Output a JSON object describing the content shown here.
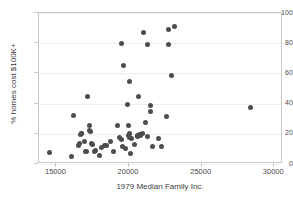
{
  "chart_data": {
    "type": "scatter",
    "title": "",
    "xlabel": "1979 Median Family Inc.",
    "ylabel": "% homes cost $100K+",
    "xlim": [
      13800,
      30600
    ],
    "ylim": [
      0,
      100
    ],
    "xticks": [
      15000,
      20000,
      25000,
      30000
    ],
    "yticks": [
      0,
      20,
      40,
      60,
      80,
      100
    ],
    "grid": "horizontal",
    "legend": "none",
    "marker_color": "#4d4d4d",
    "marker_size": 5,
    "series": [
      {
        "name": "observations",
        "points": [
          [
            14550,
            7.6
          ],
          [
            16050,
            5.1
          ],
          [
            16200,
            31.9
          ],
          [
            16500,
            12.0
          ],
          [
            16600,
            13.5
          ],
          [
            16650,
            19.3
          ],
          [
            16700,
            20.5
          ],
          [
            16750,
            20.0
          ],
          [
            16900,
            15.1
          ],
          [
            17000,
            8.3
          ],
          [
            17100,
            8.2
          ],
          [
            17150,
            44.6
          ],
          [
            17250,
            25.4
          ],
          [
            17300,
            22.0
          ],
          [
            17350,
            21.2
          ],
          [
            17400,
            13.9
          ],
          [
            17500,
            12.8
          ],
          [
            17600,
            8.6
          ],
          [
            17700,
            9.0
          ],
          [
            17950,
            5.8
          ],
          [
            18100,
            11.0
          ],
          [
            18300,
            12.3
          ],
          [
            18450,
            12.4
          ],
          [
            18750,
            14.7
          ],
          [
            18900,
            8.6
          ],
          [
            19200,
            25.3
          ],
          [
            19350,
            17.8
          ],
          [
            19450,
            79.6
          ],
          [
            19500,
            16.5
          ],
          [
            19550,
            11.5
          ],
          [
            19600,
            65.5
          ],
          [
            19750,
            10.5
          ],
          [
            19900,
            39.1
          ],
          [
            19950,
            25.6
          ],
          [
            19980,
            19.0
          ],
          [
            20000,
            17.7
          ],
          [
            20020,
            20.4
          ],
          [
            20050,
            54.4
          ],
          [
            20080,
            7.2
          ],
          [
            20200,
            16.9
          ],
          [
            20400,
            12.6
          ],
          [
            20550,
            18.0
          ],
          [
            20600,
            18.9
          ],
          [
            20650,
            44.9
          ],
          [
            20750,
            19.6
          ],
          [
            20800,
            19.0
          ],
          [
            20900,
            20.2
          ],
          [
            21000,
            87.4
          ],
          [
            21100,
            27.4
          ],
          [
            21250,
            18.0
          ],
          [
            21300,
            79.0
          ],
          [
            21450,
            39.0
          ],
          [
            21500,
            34.9
          ],
          [
            21600,
            11.9
          ],
          [
            22050,
            16.7
          ],
          [
            22250,
            11.6
          ],
          [
            22600,
            31.4
          ],
          [
            22700,
            88.8
          ],
          [
            22750,
            79.4
          ],
          [
            22900,
            58.4
          ],
          [
            23100,
            91.2
          ],
          [
            28350,
            37.3
          ]
        ]
      }
    ]
  },
  "axis": {
    "y_tick_labels": [
      "0",
      "20",
      "40",
      "60",
      "80",
      "100"
    ],
    "x_tick_labels": [
      "15000",
      "20000",
      "25000",
      "30000"
    ]
  }
}
